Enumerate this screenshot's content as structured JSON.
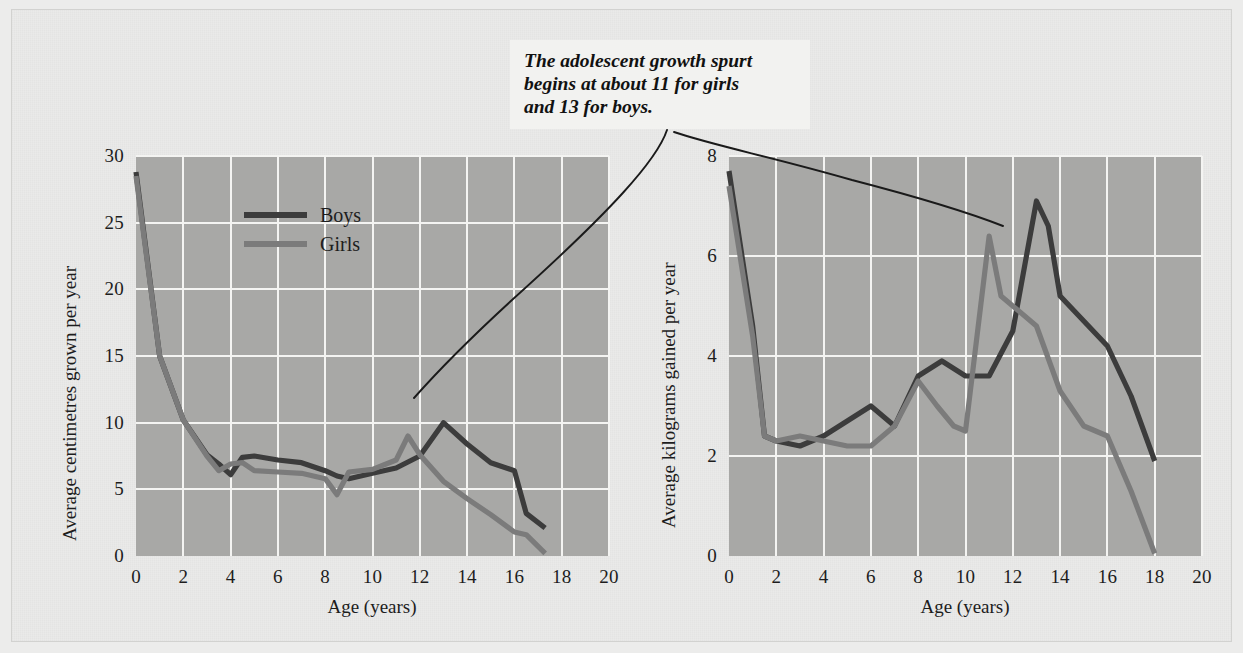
{
  "annotation": {
    "text": "The adolescent growth spurt begins at about 11 for girls and 13 for boys.",
    "line1": "The adolescent growth spurt",
    "line2": "begins at about 11 for girls",
    "line3": "and 13 for boys."
  },
  "colors": {
    "boys": "#3c3c3c",
    "girls": "#7b7b7b",
    "plot_background": "#a8a8a6",
    "gridline": "#f4f4f2",
    "figure_background": "#eaeae9",
    "callout_background": "#f2f2f0",
    "text": "#1d1d1d"
  },
  "legend": {
    "position": "inside-top-center-left-chart",
    "entries": [
      {
        "label": "Boys",
        "color": "#3c3c3c"
      },
      {
        "label": "Girls",
        "color": "#7b7b7b"
      }
    ]
  },
  "chart_data": [
    {
      "id": "height-velocity",
      "type": "line",
      "title": "",
      "xlabel": "Age (years)",
      "ylabel": "Average centimetres grown per year",
      "xlim": [
        0,
        20
      ],
      "ylim": [
        0,
        30
      ],
      "xticks": [
        0,
        2,
        4,
        6,
        8,
        10,
        12,
        14,
        16,
        18,
        20
      ],
      "yticks": [
        0,
        5,
        10,
        15,
        20,
        25,
        30
      ],
      "grid": true,
      "legend": [
        "Boys",
        "Girls"
      ],
      "series": [
        {
          "name": "Boys",
          "color": "#3c3c3c",
          "x": [
            0,
            1,
            2,
            3,
            3.5,
            4,
            4.5,
            5,
            6,
            7,
            8,
            8.5,
            9,
            10,
            11,
            12,
            13,
            14,
            15,
            16,
            16.5,
            17.3
          ],
          "values": [
            28.8,
            15.0,
            10.2,
            7.6,
            6.9,
            6.1,
            7.4,
            7.5,
            7.2,
            7.0,
            6.4,
            6.0,
            5.8,
            6.2,
            6.6,
            7.5,
            10.0,
            8.4,
            7.0,
            6.4,
            3.2,
            2.1
          ]
        },
        {
          "name": "Girls",
          "color": "#7b7b7b",
          "x": [
            0,
            1,
            2,
            3,
            3.5,
            4,
            4.5,
            5,
            6,
            7,
            8,
            8.5,
            9,
            10,
            11,
            11.5,
            12,
            13,
            14,
            15,
            16,
            16.5,
            17.3
          ],
          "values": [
            28.5,
            15.0,
            10.2,
            7.5,
            6.4,
            6.9,
            7.0,
            6.4,
            6.3,
            6.2,
            5.8,
            4.6,
            6.3,
            6.5,
            7.2,
            9.0,
            7.6,
            5.6,
            4.3,
            3.1,
            1.8,
            1.6,
            0.2
          ]
        }
      ]
    },
    {
      "id": "weight-velocity",
      "type": "line",
      "title": "",
      "xlabel": "Age (years)",
      "ylabel": "Average kilograms gained per year",
      "xlim": [
        0,
        20
      ],
      "ylim": [
        0,
        8
      ],
      "xticks": [
        0,
        2,
        4,
        6,
        8,
        10,
        12,
        14,
        16,
        18,
        20
      ],
      "yticks": [
        0,
        2,
        4,
        6,
        8
      ],
      "grid": true,
      "legend": [
        "Boys",
        "Girls"
      ],
      "series": [
        {
          "name": "Boys",
          "color": "#3c3c3c",
          "x": [
            0,
            1,
            1.5,
            2,
            3,
            4,
            5,
            6,
            7,
            7.5,
            8,
            9,
            10,
            11,
            12,
            13,
            13.5,
            14,
            15,
            16,
            17,
            18
          ],
          "values": [
            7.7,
            4.6,
            2.4,
            2.3,
            2.2,
            2.4,
            2.7,
            3.0,
            2.6,
            3.1,
            3.6,
            3.9,
            3.6,
            3.6,
            4.5,
            7.1,
            6.6,
            5.2,
            4.7,
            4.2,
            3.2,
            1.9
          ]
        },
        {
          "name": "Girls",
          "color": "#7b7b7b",
          "x": [
            0,
            1,
            1.5,
            2,
            3,
            4,
            5,
            6,
            7,
            8,
            8.8,
            9.5,
            10,
            11,
            11.5,
            12,
            13,
            14,
            15,
            16,
            17,
            18
          ],
          "values": [
            7.4,
            4.4,
            2.4,
            2.3,
            2.4,
            2.3,
            2.2,
            2.2,
            2.6,
            3.5,
            3.0,
            2.6,
            2.5,
            6.4,
            5.2,
            5.0,
            4.6,
            3.3,
            2.6,
            2.4,
            1.3,
            0.05
          ]
        }
      ]
    }
  ],
  "left_chart": {
    "ylabel": "Average centimetres grown per year",
    "xlabel": "Age (years)",
    "yticks": [
      "0",
      "5",
      "10",
      "15",
      "20",
      "25",
      "30"
    ],
    "xticks": [
      "0",
      "2",
      "4",
      "6",
      "8",
      "10",
      "12",
      "14",
      "16",
      "18",
      "20"
    ]
  },
  "right_chart": {
    "ylabel": "Average kilograms gained per year",
    "xlabel": "Age (years)",
    "yticks": [
      "0",
      "2",
      "4",
      "6",
      "8"
    ],
    "xticks": [
      "0",
      "2",
      "4",
      "6",
      "8",
      "10",
      "12",
      "14",
      "16",
      "18",
      "20"
    ]
  }
}
